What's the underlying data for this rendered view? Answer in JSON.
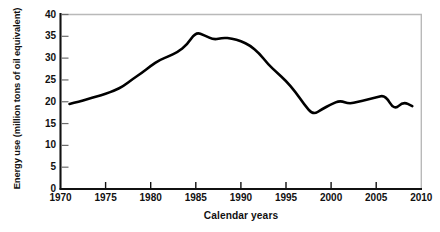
{
  "chart_data": {
    "type": "line",
    "title": "",
    "xlabel": "Calendar years",
    "ylabel": "Energy use (million tons of oil equivalent)",
    "xlim": [
      1970,
      2010
    ],
    "ylim": [
      0,
      40
    ],
    "xticks": [
      1970,
      1975,
      1980,
      1985,
      1990,
      1995,
      2000,
      2005,
      2010
    ],
    "yticks": [
      0,
      5,
      10,
      15,
      20,
      25,
      30,
      35,
      40
    ],
    "grid": false,
    "legend": "none",
    "line_color": "#000000",
    "line_width": 2.6,
    "series": [
      {
        "name": "Energy use",
        "x": [
          1971,
          1972,
          1973,
          1974,
          1975,
          1976,
          1977,
          1978,
          1979,
          1980,
          1981,
          1982,
          1983,
          1984,
          1985,
          1986,
          1987,
          1988,
          1989,
          1990,
          1991,
          1992,
          1993,
          1994,
          1995,
          1996,
          1997,
          1998,
          1999,
          2000,
          2001,
          2002,
          2003,
          2004,
          2005,
          2006,
          2007,
          2008,
          2009
        ],
        "values": [
          19.5,
          20.0,
          20.6,
          21.2,
          21.8,
          22.6,
          23.6,
          25.2,
          26.6,
          28.2,
          29.6,
          30.4,
          31.4,
          33.0,
          36.0,
          35.2,
          34.2,
          34.7,
          34.5,
          33.9,
          32.9,
          31.2,
          28.6,
          26.7,
          24.8,
          22.4,
          19.4,
          17.0,
          18.3,
          19.4,
          20.3,
          19.5,
          20.0,
          20.5,
          21.0,
          21.5,
          18.1,
          20.0,
          19.0
        ]
      }
    ]
  },
  "axis": {
    "ytick_labels": [
      "0",
      "5",
      "10",
      "15",
      "20",
      "25",
      "30",
      "35",
      "40"
    ],
    "xtick_labels": [
      "1970",
      "1975",
      "1980",
      "1985",
      "1990",
      "1995",
      "2000",
      "2005",
      "2010"
    ]
  },
  "colors": {
    "line": "#000000",
    "axis": "#111111",
    "frame_light": "#b9b9b9",
    "background": "#ffffff"
  }
}
